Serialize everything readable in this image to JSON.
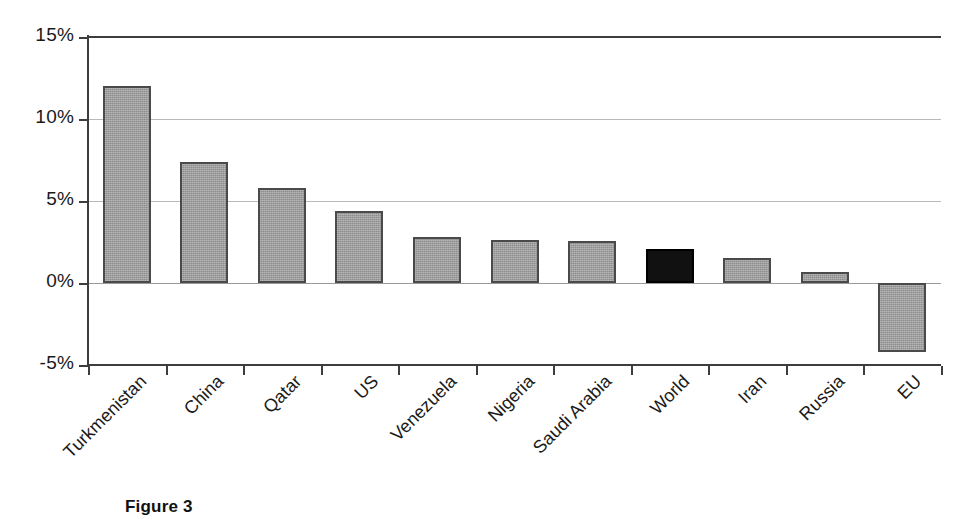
{
  "figure": {
    "caption": "Figure 3"
  },
  "chart_data": {
    "type": "bar",
    "title": "",
    "xlabel": "",
    "ylabel": "",
    "ylim": [
      -5,
      15
    ],
    "yticks": [
      15,
      10,
      5,
      0,
      -5
    ],
    "ytick_labels": [
      "15%",
      "10%",
      "5%",
      "0%",
      "-5%"
    ],
    "grid": true,
    "legend": "none",
    "value_unit": "%",
    "categories": [
      "Turkmenistan",
      "China",
      "Qatar",
      "US",
      "Venezuela",
      "Nigeria",
      "Saudi Arabia",
      "World",
      "Iran",
      "Russia",
      "EU"
    ],
    "values": [
      12.0,
      7.4,
      5.8,
      4.4,
      2.8,
      2.65,
      2.55,
      2.1,
      1.5,
      0.7,
      -4.2
    ],
    "bar_colors": [
      "#9b9b9b",
      "#9b9b9b",
      "#9b9b9b",
      "#9b9b9b",
      "#9b9b9b",
      "#9b9b9b",
      "#9b9b9b",
      "#111111",
      "#9b9b9b",
      "#9b9b9b",
      "#9b9b9b"
    ],
    "highlight_category": "World",
    "highlight_color": "#111111",
    "series_color": "#9b9b9b",
    "axis_color": "#3d3d3d",
    "gridline_color": "#b9b9b9"
  }
}
